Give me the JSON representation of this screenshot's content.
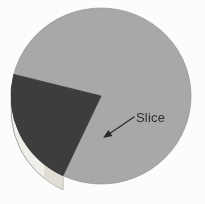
{
  "figure": {
    "title": "",
    "background_color": "#fcfcfc",
    "width": 205,
    "height": 204
  },
  "annotation": {
    "label": "Slice",
    "label_color": "#2e2e2e",
    "arrow_color": "#2b2b2b",
    "arrow_tip_x": 103,
    "arrow_tip_y": 138,
    "arrow_tail_x": 134,
    "arrow_tail_y": 117
  },
  "chart_data": {
    "type": "pie",
    "title": "",
    "subtitle": "",
    "xlabel": "",
    "ylabel": "",
    "legend": [],
    "legend_position": "none",
    "grid": false,
    "three_d": true,
    "exploded_slice_index": 1,
    "start_angle_deg": 115,
    "direction": "clockwise",
    "categories": [
      "Remainder",
      "Slice"
    ],
    "values": [
      78,
      22
    ],
    "labels": [
      "",
      "Slice"
    ],
    "colors": [
      "#a8a8a8",
      "#3d3d3d"
    ],
    "side_wall_colors": [
      "#e8e6e0",
      "#f0eee8"
    ],
    "edge_color": "#6f6f6f",
    "center_x": 101,
    "center_y": 96,
    "radius_x": 90,
    "radius_y": 88,
    "depth": 14
  }
}
